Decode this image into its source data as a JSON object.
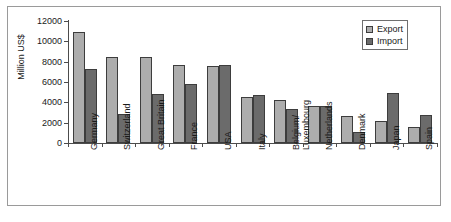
{
  "chart_data": {
    "type": "bar",
    "title": "",
    "xlabel": "",
    "ylabel": "Million US$",
    "ylim": [
      0,
      12000
    ],
    "yticks": [
      0,
      2000,
      4000,
      6000,
      8000,
      10000,
      12000
    ],
    "grid": false,
    "legend_position": "top-right",
    "categories": [
      "Germany",
      "Switzerland",
      "Great Britain",
      "France",
      "USA",
      "Italy",
      "Belgium/ Luxembourg",
      "Netherlands",
      "Denmark",
      "Japan",
      "Spain"
    ],
    "category_lines": [
      [
        "Germany"
      ],
      [
        "Switzerland"
      ],
      [
        "Great Britain"
      ],
      [
        "France"
      ],
      [
        "USA"
      ],
      [
        "Italy"
      ],
      [
        "Belgium/",
        "Luxembourg"
      ],
      [
        "Netherlands"
      ],
      [
        "Denmark"
      ],
      [
        "Japan"
      ],
      [
        "Spain"
      ]
    ],
    "series": [
      {
        "name": "Export",
        "color": "#adadad",
        "values": [
          10900,
          8450,
          8450,
          7700,
          7550,
          4500,
          4250,
          3600,
          2700,
          2150,
          1550
        ]
      },
      {
        "name": "Import",
        "color": "#6b6b6b",
        "values": [
          7250,
          2900,
          4850,
          5850,
          7650,
          4700,
          3350,
          3600,
          1050,
          4900,
          2750
        ]
      }
    ]
  },
  "legend": {
    "items": [
      {
        "label": "Export"
      },
      {
        "label": "Import"
      }
    ]
  },
  "colors": {
    "export": "#adadad",
    "import": "#6b6b6b",
    "axis": "#4c4c4c",
    "frame": "#9a9a9a",
    "text": "#1a1a1a"
  }
}
